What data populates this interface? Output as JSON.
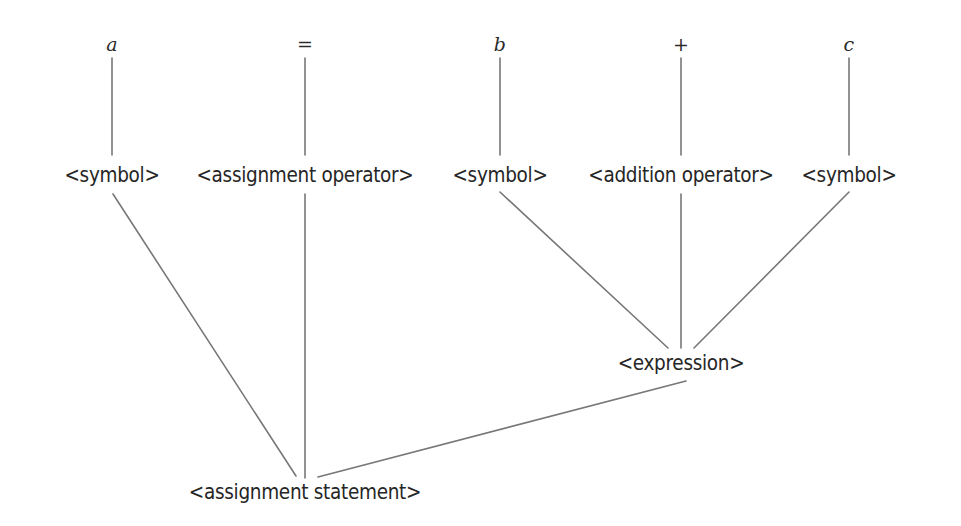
{
  "diagram": {
    "background_color": "#ffffff",
    "edge_color": "#777777",
    "text_color": "#2b2b2b",
    "edge_width": 1.6,
    "terminals": [
      {
        "label": "a",
        "x": 112,
        "y": 44,
        "style": "italic"
      },
      {
        "label": "=",
        "x": 305,
        "y": 44,
        "style": "operator"
      },
      {
        "label": "b",
        "x": 500,
        "y": 44,
        "style": "italic"
      },
      {
        "label": "+",
        "x": 681,
        "y": 44,
        "style": "operator"
      },
      {
        "label": "c",
        "x": 849,
        "y": 44,
        "style": "italic"
      }
    ],
    "nonterminals": [
      {
        "label": "<symbol>",
        "x": 112,
        "y": 175
      },
      {
        "label": "<assignment operator>",
        "x": 305,
        "y": 175
      },
      {
        "label": "<symbol>",
        "x": 500,
        "y": 175
      },
      {
        "label": "<addition operator>",
        "x": 681,
        "y": 175
      },
      {
        "label": "<symbol>",
        "x": 849,
        "y": 175
      }
    ],
    "internal_nodes": [
      {
        "label": "<expression>",
        "x": 681,
        "y": 363
      },
      {
        "label": "<assignment statement>",
        "x": 305,
        "y": 492
      }
    ],
    "edges": [
      {
        "from": "a",
        "to": "<symbol> 1",
        "x1": 112,
        "y1": 58,
        "x2": 112,
        "y2": 155
      },
      {
        "from": "=",
        "to": "<assignment operator>",
        "x1": 305,
        "y1": 58,
        "x2": 305,
        "y2": 155
      },
      {
        "from": "b",
        "to": "<symbol> 2",
        "x1": 500,
        "y1": 58,
        "x2": 500,
        "y2": 155
      },
      {
        "from": "+",
        "to": "<addition operator>",
        "x1": 681,
        "y1": 58,
        "x2": 681,
        "y2": 155
      },
      {
        "from": "c",
        "to": "<symbol> 3",
        "x1": 849,
        "y1": 58,
        "x2": 849,
        "y2": 155
      },
      {
        "from": "<symbol> 1",
        "to": "<assignment statement>",
        "x1": 113,
        "y1": 194,
        "x2": 296,
        "y2": 476
      },
      {
        "from": "<assignment operator>",
        "to": "<assignment statement>",
        "x1": 305,
        "y1": 194,
        "x2": 305,
        "y2": 478
      },
      {
        "from": "<symbol> 2",
        "to": "<expression>",
        "x1": 500,
        "y1": 192,
        "x2": 668,
        "y2": 348
      },
      {
        "from": "<addition operator>",
        "to": "<expression>",
        "x1": 681,
        "y1": 194,
        "x2": 681,
        "y2": 348
      },
      {
        "from": "<symbol> 3",
        "to": "<expression>",
        "x1": 849,
        "y1": 192,
        "x2": 694,
        "y2": 348
      },
      {
        "from": "<expression>",
        "to": "<assignment statement>",
        "x1": 686,
        "y1": 381,
        "x2": 318,
        "y2": 477
      }
    ]
  }
}
